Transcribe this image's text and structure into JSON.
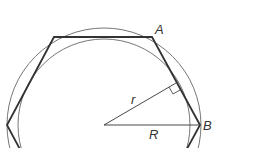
{
  "diagram": {
    "labels": {
      "vertex_a": "A",
      "vertex_b": "B",
      "inradius": "r",
      "circumradius": "R"
    },
    "colors": {
      "stroke": "#333333",
      "circle_stroke": "#666666",
      "background": "#ffffff"
    }
  }
}
